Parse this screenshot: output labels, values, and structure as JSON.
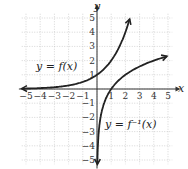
{
  "chart_data": {
    "type": "line",
    "title": "",
    "xlabel": "x",
    "ylabel": "y",
    "xlim": [
      -5,
      5
    ],
    "ylim": [
      -5,
      5
    ],
    "grid": true,
    "x_ticks": [
      "-5",
      "-4",
      "-3",
      "-2",
      "-1",
      "1",
      "2",
      "3",
      "4",
      "5"
    ],
    "y_ticks": [
      "5",
      "4",
      "3",
      "2",
      "1",
      "-1",
      "-2",
      "-3",
      "-4",
      "-5"
    ],
    "series": [
      {
        "name": "y = f(x)",
        "function": "2^x",
        "points": [
          [
            -5,
            0.03
          ],
          [
            -4,
            0.06
          ],
          [
            -3,
            0.125
          ],
          [
            -2,
            0.25
          ],
          [
            -1,
            0.5
          ],
          [
            0,
            1
          ],
          [
            1,
            2
          ],
          [
            2,
            4
          ],
          [
            2.32,
            5
          ]
        ]
      },
      {
        "name": "y = f^-1(x)",
        "function": "log2(x)",
        "points": [
          [
            0.03,
            -5
          ],
          [
            0.0625,
            -4
          ],
          [
            0.125,
            -3
          ],
          [
            0.25,
            -2
          ],
          [
            0.5,
            -1
          ],
          [
            1,
            0
          ],
          [
            2,
            1
          ],
          [
            4,
            2
          ],
          [
            5,
            2.32
          ]
        ]
      }
    ],
    "annotations": [
      "y = f(x)",
      "y = f⁻¹(x)"
    ]
  },
  "labels": {
    "x_axis": "x",
    "y_axis": "y",
    "f_label": "y = f(x)",
    "finv_label": "y = f⁻¹(x)"
  }
}
